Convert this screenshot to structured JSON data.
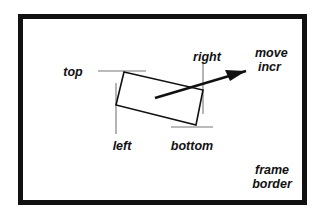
{
  "figure": {
    "type": "diagram",
    "background_color": "#ffffff",
    "ink_color": "#111111",
    "thin_line_color": "#777777"
  },
  "frame": {
    "name": "frame-border",
    "border_color": "#111111",
    "border_width_px": 5,
    "fill_color": "#ffffff",
    "rect": {
      "x": 18,
      "y": 14,
      "width": 289,
      "height": 191
    }
  },
  "inner_rect": {
    "name": "rotated-rectangle",
    "stroke_color": "#111111",
    "stroke_width_px": 1.6,
    "fill": "none",
    "points": "124,72 203,90 196,125 116,105"
  },
  "guides": [
    {
      "name": "top-guide-line",
      "orientation": "horizontal",
      "x1": 98,
      "y1": 71,
      "x2": 146,
      "y2": 71
    },
    {
      "name": "left-guide-line",
      "orientation": "vertical",
      "x1": 116,
      "y1": 83,
      "x2": 116,
      "y2": 134
    },
    {
      "name": "right-guide-line",
      "orientation": "vertical",
      "x1": 203,
      "y1": 62,
      "x2": 203,
      "y2": 114
    },
    {
      "name": "bottom-guide-line",
      "orientation": "horizontal",
      "x1": 171,
      "y1": 127,
      "x2": 213,
      "y2": 127
    }
  ],
  "arrow": {
    "name": "move-increment-arrow",
    "stroke_color": "#111111",
    "stroke_width_px": 2.6,
    "tail": {
      "x": 155,
      "y": 98
    },
    "head": {
      "x": 246,
      "y": 71
    },
    "head_polygon": "246,71 225,70 230,81"
  },
  "labels": [
    {
      "name": "label-top",
      "text": "top",
      "x": 73,
      "y": 76,
      "anchor": "middle"
    },
    {
      "name": "label-left",
      "text": "left",
      "x": 122,
      "y": 150,
      "anchor": "middle"
    },
    {
      "name": "label-right",
      "text": "right",
      "x": 207,
      "y": 61,
      "anchor": "middle"
    },
    {
      "name": "label-bottom",
      "text": "bottom",
      "x": 192,
      "y": 150,
      "anchor": "middle"
    },
    {
      "name": "label-move",
      "text": "move",
      "x": 255,
      "y": 57,
      "anchor": "start"
    },
    {
      "name": "label-incr",
      "text": "incr",
      "x": 258,
      "y": 71,
      "anchor": "start"
    },
    {
      "name": "label-frame",
      "text": "frame",
      "x": 272,
      "y": 174,
      "anchor": "middle"
    },
    {
      "name": "label-border",
      "text": "border",
      "x": 272,
      "y": 188,
      "anchor": "middle"
    }
  ]
}
